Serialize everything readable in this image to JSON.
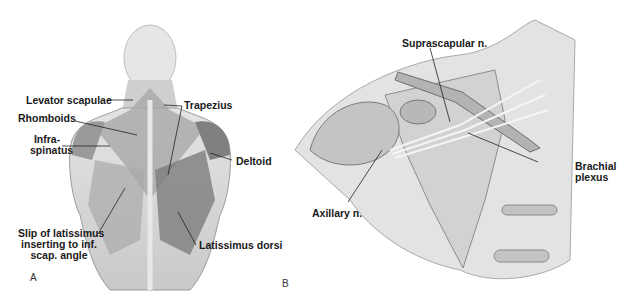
{
  "figure": {
    "panels": [
      {
        "letter": "A",
        "view": "posterior back muscles",
        "labels": {
          "levator_scapulae": "Levator scapulae",
          "rhomboids": "Rhomboids",
          "infraspinatus_1": "Infra-",
          "infraspinatus_2": "spinatus",
          "trapezius": "Trapezius",
          "deltoid": "Deltoid",
          "slip_1": "Slip of latissimus",
          "slip_2": "inserting to inf.",
          "slip_3": "scap. angle",
          "latissimus_dorsi": "Latissimus dorsi"
        }
      },
      {
        "letter": "B",
        "view": "shoulder nerves",
        "labels": {
          "suprascapular": "Suprascapular n.",
          "brachial_1": "Brachial",
          "brachial_2": "plexus",
          "axillary": "Axillary n."
        }
      }
    ]
  }
}
